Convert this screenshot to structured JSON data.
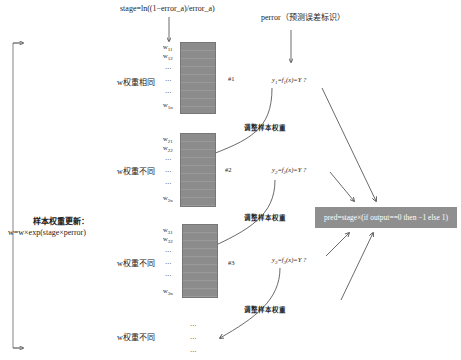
{
  "header": {
    "stage_formula": "stage=ln((1−error_a)/error_a)",
    "perror_label": "perror（预测误差标识）"
  },
  "left": {
    "update_title": "样本权重更新：",
    "update_formula": "w=w×exp(stage×perror)"
  },
  "stages": [
    {
      "group_label": "w权重相同",
      "index_label": "#1",
      "weights": [
        "w",
        "w",
        "…",
        "…",
        "…",
        "w"
      ],
      "weight_subs": [
        "11",
        "12",
        "",
        "",
        "",
        "1n"
      ],
      "eq_y": "y",
      "eq_y_sub": "1",
      "eq_mid": "=f",
      "eq_f_sub": "1",
      "eq_tail": "(x)=Y ?"
    },
    {
      "group_label": "w权重不同",
      "index_label": "#2",
      "weights": [
        "w",
        "w",
        "…",
        "…",
        "…",
        "w"
      ],
      "weight_subs": [
        "21",
        "22",
        "",
        "",
        "",
        "2n"
      ],
      "eq_y": "y",
      "eq_y_sub": "2",
      "eq_mid": "=f",
      "eq_f_sub": "2",
      "eq_tail": "(x)=Y ?"
    },
    {
      "group_label": "w权重不同",
      "index_label": "#3",
      "weights": [
        "w",
        "w",
        "…",
        "…",
        "…",
        "w"
      ],
      "weight_subs": [
        "31",
        "32",
        "",
        "",
        "",
        "3n"
      ],
      "eq_y": "y",
      "eq_y_sub": "3",
      "eq_mid": "=f",
      "eq_f_sub": "3",
      "eq_tail": "(x)=Y ?"
    },
    {
      "group_label": "w权重不同",
      "dots": [
        "…",
        "…",
        "…"
      ]
    }
  ],
  "adjust_labels": [
    "调整样本权重",
    "调整样本权重",
    "调整样本权重"
  ],
  "pred_box": {
    "label": "pred=stage×(if output==0 then −1 else 1)"
  },
  "colors": {
    "weight_box": "#8c8c8c",
    "pred_box": "#8f8f8f",
    "line": "#444444"
  }
}
